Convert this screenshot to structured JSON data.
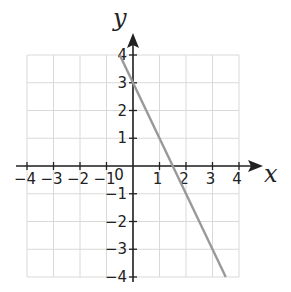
{
  "chart_data": {
    "type": "line",
    "title": "",
    "xlabel": "x",
    "ylabel": "y",
    "xlim": [
      -4,
      4
    ],
    "ylim": [
      -4,
      4
    ],
    "grid": true,
    "x_ticks": [
      -4,
      -3,
      -2,
      -1,
      0,
      1,
      2,
      3,
      4
    ],
    "y_ticks": [
      -4,
      -3,
      -2,
      -1,
      1,
      2,
      3,
      4
    ],
    "x_tick_labels": [
      "−4",
      "−3",
      "−2",
      "−1",
      "0",
      "1",
      "2",
      "3",
      "4"
    ],
    "y_tick_labels": [
      "−4",
      "−3",
      "−2",
      "−1",
      "1",
      "2",
      "3",
      "4"
    ],
    "origin_label": "0",
    "series": [
      {
        "name": "y = -2x + 3",
        "color": "#999999",
        "x": [
          -0.5,
          3.5
        ],
        "y": [
          4,
          -4
        ]
      }
    ]
  },
  "colors": {
    "grid": "#d9d9d9",
    "axis": "#222222",
    "line": "#999999"
  }
}
